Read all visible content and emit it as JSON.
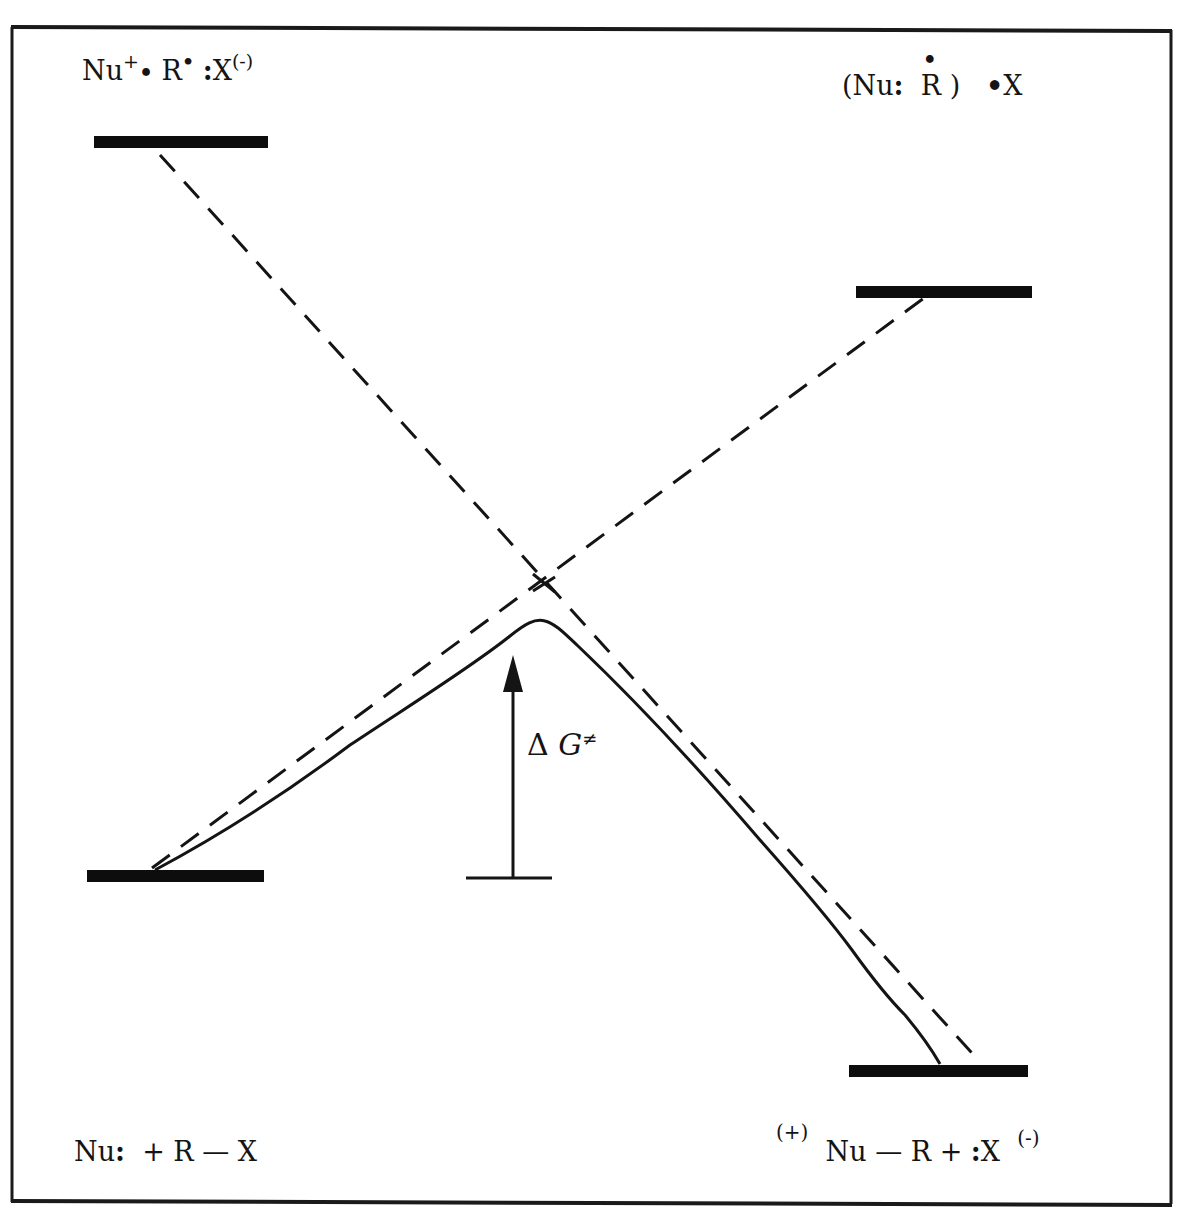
{
  "figure": {
    "type": "state-correlation-diagram",
    "header_text_partially_visible": true,
    "colors": {
      "ink": "#141414",
      "background": "#ffffff"
    }
  },
  "labels": {
    "top_left": {
      "text": "Nu+• R• :X(-)",
      "parts": {
        "nu": "Nu",
        "nu_charge": "+",
        "r": "R",
        "r_radical": "•",
        "x_pair": ":",
        "x": "X",
        "x_charge": "(-)"
      }
    },
    "top_right": {
      "text": "(Nu: •R ) •X",
      "parts": {
        "open": "(Nu",
        "pair": ":",
        "r_radical": "•",
        "r": "R",
        "close": ")",
        "x_radical": "•",
        "x": "X"
      }
    },
    "bottom_left": {
      "text": "Nu: + R — X",
      "parts": {
        "nu": "Nu",
        "pair": ":",
        "rest": "+ R — X"
      }
    },
    "bottom_right": {
      "text": "(+) Nu — R + :X (-)",
      "parts": {
        "pre_charge": "(+)",
        "body": "Nu — R +",
        "pair": ":",
        "x": "X",
        "x_charge": "(-)"
      }
    },
    "barrier": {
      "text": "ΔG≠",
      "parts": {
        "delta": "Δ",
        "g": "G",
        "ne": "≠"
      }
    }
  },
  "levels": [
    {
      "name": "reactant-excited",
      "x1": 94,
      "x2": 268,
      "y": 142
    },
    {
      "name": "product-excited",
      "x1": 856,
      "x2": 1032,
      "y": 292
    },
    {
      "name": "reactant-ground",
      "x1": 87,
      "x2": 264,
      "y": 876
    },
    {
      "name": "product-ground",
      "x1": 849,
      "x2": 1028,
      "y": 1071
    }
  ],
  "curves": {
    "dashed_descending": {
      "from": [
        160,
        155
      ],
      "to": [
        980,
        1062
      ]
    },
    "dashed_ascending": {
      "from": [
        152,
        868
      ],
      "to": [
        928,
        295
      ]
    },
    "crossing_point": [
      543,
      582
    ],
    "solid_ground_state": {
      "start": [
        155,
        870
      ],
      "peak": [
        537,
        620
      ],
      "end": [
        940,
        1064
      ]
    }
  },
  "barrier_arrow": {
    "x": 513,
    "y_base": 878,
    "y_tip": 655,
    "baseline_x1": 466,
    "baseline_x2": 552
  }
}
